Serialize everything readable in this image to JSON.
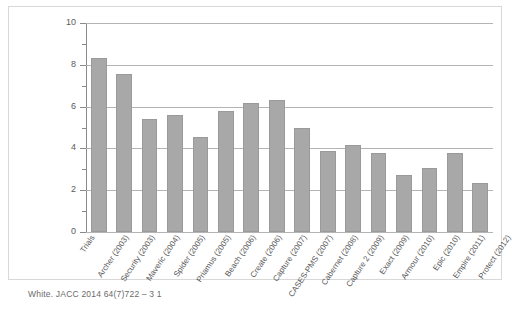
{
  "chart_data": {
    "type": "bar",
    "title": "",
    "xlabel": "",
    "ylabel": "",
    "ylim": [
      0,
      10
    ],
    "ytick_values": [
      0,
      2,
      4,
      6,
      8,
      10
    ],
    "ytick_labels": [
      "0",
      "2",
      "4",
      "6",
      "8",
      "10"
    ],
    "yminor_values": [
      1,
      3,
      5,
      7,
      9
    ],
    "grid": true,
    "gridlines_at": [
      2,
      4,
      6,
      8,
      10
    ],
    "legend": null,
    "bar_color": "#a8a8a8",
    "bar_edge_color": "#9a9a9a",
    "grid_color": "#b4b4b4",
    "axis_color": "#8a8a8a",
    "axis_category_label": "Trials",
    "categories": [
      "Archer (2003)",
      "Security (2003)",
      "Maveric (2004)",
      "Spider (2005)",
      "Priamus (2005)",
      "Beach (2006)",
      "Create (2006)",
      "Capture (2007)",
      "CASES-PMS (2007)",
      "Cabernet (2008)",
      "Capture 2 (2009)",
      "Exact (2009)",
      "Armour (2010)",
      "Epic (2010)",
      "Empire (2011)",
      "Protect (2012)"
    ],
    "values": [
      8.35,
      7.55,
      5.4,
      5.6,
      4.55,
      5.8,
      6.15,
      6.3,
      5.0,
      3.9,
      4.15,
      3.8,
      2.75,
      3.05,
      3.8,
      2.35
    ]
  },
  "citation": "White. JACC  2014 64(7)722 – 3 1"
}
